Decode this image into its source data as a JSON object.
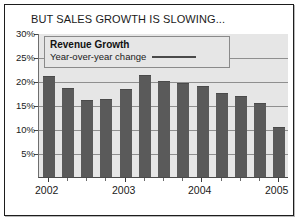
{
  "chart_data": {
    "type": "bar",
    "title": "BUT SALES GROWTH IS SLOWING...",
    "xlabel": "",
    "ylabel": "",
    "ylim": [
      0,
      30
    ],
    "yticks": [
      5,
      10,
      15,
      20,
      25,
      30
    ],
    "ytick_labels": [
      "5%",
      "10%",
      "15%",
      "20%",
      "25%",
      "30%"
    ],
    "grid": true,
    "legend_position": "inside-top-left",
    "legend": [
      {
        "name": "Revenue Growth",
        "subtitle": "Year-over-year change",
        "color": "#5a5a5a"
      }
    ],
    "x_axis_group_labels": [
      "2002",
      "2003",
      "2004",
      "2005"
    ],
    "categories": [
      "2002 Q1",
      "2002 Q2",
      "2002 Q3",
      "2002 Q4",
      "2003 Q1",
      "2003 Q2",
      "2003 Q3",
      "2003 Q4",
      "2004 Q1",
      "2004 Q2",
      "2004 Q3",
      "2004 Q4",
      "2005 Q1"
    ],
    "values": [
      21.0,
      18.5,
      16.0,
      16.2,
      18.3,
      21.2,
      20.0,
      19.5,
      18.9,
      17.5,
      16.8,
      15.5,
      10.5
    ],
    "series": [
      {
        "name": "Revenue Growth",
        "values": [
          21.0,
          18.5,
          16.0,
          16.2,
          18.3,
          21.2,
          20.0,
          19.5,
          18.9,
          17.5,
          16.8,
          15.5,
          10.5
        ]
      }
    ],
    "colors": {
      "bar": "#5a5a5a",
      "plot_background": "#e6e6e6",
      "gridline": "#8f8f8f",
      "frame": "#1d1d1d",
      "text": "#1a1a1a"
    }
  }
}
